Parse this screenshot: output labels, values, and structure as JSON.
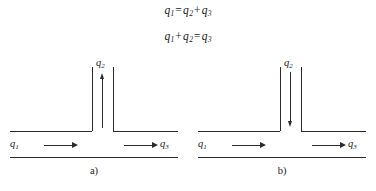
{
  "figure": {
    "equations": [
      {
        "id": "eq-1",
        "lhs": "q",
        "lhs_sub": "1",
        "text": "q1 = q2 + q3",
        "t1": "q",
        "s1": "1",
        "op1": "=",
        "t2": "q",
        "s2": "2",
        "op2": "+",
        "t3": "q",
        "s3": "3"
      },
      {
        "id": "eq-2",
        "text": "q1 + q2 = q3",
        "t1": "q",
        "s1": "1",
        "op1": "+",
        "t2": "q",
        "s2": "2",
        "op2": "=",
        "t3": "q",
        "s3": "3"
      }
    ],
    "diagrams": [
      {
        "caption": "a)",
        "branch_flow_direction": "up",
        "labels": {
          "inlet": {
            "symbol": "q",
            "sub": "1"
          },
          "branch": {
            "symbol": "q",
            "sub": "2"
          },
          "outlet": {
            "symbol": "q",
            "sub": "3"
          }
        },
        "horizontal_arrows": [
          "right",
          "right"
        ]
      },
      {
        "caption": "b)",
        "branch_flow_direction": "down",
        "labels": {
          "inlet": {
            "symbol": "q",
            "sub": "1"
          },
          "branch": {
            "symbol": "q",
            "sub": "2"
          },
          "outlet": {
            "symbol": "q",
            "sub": "3"
          }
        },
        "horizontal_arrows": [
          "right",
          "right"
        ]
      }
    ],
    "colors": {
      "background": "#ffffff",
      "ink": "#2b2b2b",
      "text": "#1b1b1b"
    }
  }
}
